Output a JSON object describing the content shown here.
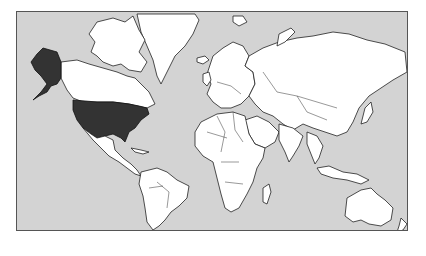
{
  "map": {
    "projection": "mercator",
    "colors": {
      "ocean": "#d3d3d3",
      "land": "#ffffff",
      "outline": "#222222",
      "highlight": "#333333"
    },
    "highlighted_regions": [
      "United States",
      "Alaska"
    ]
  }
}
